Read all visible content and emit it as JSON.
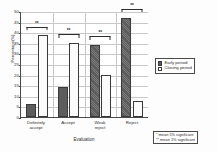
{
  "chart_data": {
    "type": "bar",
    "title": "",
    "xlabel": "Evaluation",
    "ylabel": "Percentage(%)",
    "categories": [
      "Definitely accept",
      "Accept",
      "Weak reject",
      "Reject"
    ],
    "category_lines": [
      [
        "Definitely",
        "accept"
      ],
      [
        "Accept"
      ],
      [
        "Weak",
        "reject"
      ],
      [
        "Reject"
      ]
    ],
    "series": [
      {
        "name": "Early period",
        "values": [
          6.0,
          14.3,
          34.0,
          46.5
        ],
        "color": "#5d5d5d"
      },
      {
        "name": "Closing period",
        "values": [
          38.5,
          35.0,
          20.0,
          7.5
        ],
        "color": "#ffffff"
      }
    ],
    "ylim": [
      0,
      50
    ],
    "yticks": [
      0,
      5,
      10,
      15,
      20,
      25,
      30,
      35,
      40,
      45,
      50
    ],
    "grid": true,
    "legend_position": "right",
    "annotations": [
      {
        "category": "Definitely accept",
        "mark": "**"
      },
      {
        "category": "Accept",
        "mark": "**"
      },
      {
        "category": "Weak reject",
        "mark": "**"
      },
      {
        "category": "Reject",
        "mark": "**"
      }
    ],
    "bracket_tops": [
      41.0,
      37.5,
      36.5,
      49.5
    ]
  },
  "legend": {
    "items": [
      {
        "label": "Early period",
        "swatch": "filled-dark-square"
      },
      {
        "label": "Closing period",
        "swatch": "hollow-white-square"
      }
    ]
  },
  "footnote": {
    "lines": [
      "* mean 5% significant",
      "** mean 1% significant"
    ]
  }
}
